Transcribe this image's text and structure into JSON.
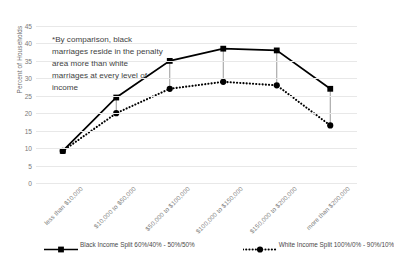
{
  "chart_data": {
    "type": "line",
    "title": "",
    "xlabel": "",
    "ylabel": "Percent of Households",
    "ylim": [
      0,
      45
    ],
    "yticks": [
      0,
      5,
      10,
      15,
      20,
      25,
      30,
      35,
      40,
      45
    ],
    "grid": true,
    "legend_position": "bottom",
    "categories": [
      "less than $10,000",
      "$10,000 to $50,000",
      "$50,000 to $100,000",
      "$100,000 to $150,000",
      "$150,000 to $200,000",
      "more than $200,000"
    ],
    "series": [
      {
        "name": "Black Income Split 60%/40% - 50%/50%",
        "style": "solid",
        "marker": "square",
        "color": "#000000",
        "values": [
          9.2,
          24.5,
          35.0,
          38.5,
          38.0,
          27.0
        ]
      },
      {
        "name": "White Income Split 100%/0% - 90%/10%",
        "style": "dotted",
        "marker": "circle",
        "color": "#000000",
        "values": [
          9.2,
          20.0,
          27.0,
          29.0,
          28.0,
          16.5
        ]
      }
    ],
    "connector_lines": {
      "description": "thin vertical drop lines joining the two series at each category",
      "categories": [
        "$10,000 to $50,000",
        "$50,000 to $100,000",
        "$100,000 to $150,000",
        "$150,000 to $200,000",
        "more than $200,000"
      ],
      "color": "#808080"
    },
    "annotations": [
      {
        "text": "*By comparison, black marriages reside in the penalty area more than white marriages at every level of income",
        "position": "upper-left"
      }
    ]
  },
  "axis": {
    "y_title": "Percent of Households"
  },
  "legend": {
    "items": [
      {
        "label": "Black Income Split 60%/40% - 50%/50%"
      },
      {
        "label": "White Income Split 100%/0% - 90%/10%"
      }
    ]
  },
  "annotation": {
    "text": "*By comparison, black marriages reside in the penalty area more than white marriages at every level of income"
  },
  "colors": {
    "series_line": "#000000",
    "gridline": "#e8e8e8",
    "tick_text": "#7a7a7a",
    "annotation_text": "#3f3f3f",
    "connector": "#808080",
    "background": "#ffffff"
  }
}
